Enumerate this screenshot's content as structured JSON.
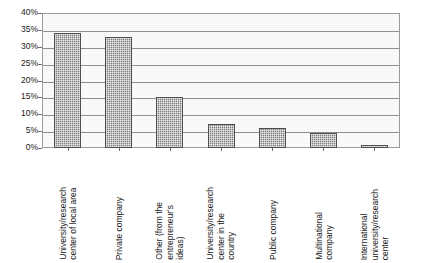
{
  "chart_data": {
    "type": "bar",
    "title": "",
    "xlabel": "",
    "ylabel": "",
    "ylim": [
      0,
      40
    ],
    "ytick_labels": [
      "40%",
      "35%",
      "30%",
      "25%",
      "20%",
      "15%",
      "10%",
      "5%",
      "0%"
    ],
    "ytick_values": [
      40,
      35,
      30,
      25,
      20,
      15,
      10,
      5,
      0
    ],
    "grid": true,
    "legend": "none",
    "categories": [
      "University/research\ncenter of local area",
      "Private company",
      "Other (from the\nentrepreneur's\nideas)",
      "University/research\ncenter in the\ncountry",
      "Public company",
      "Multinational\ncompany",
      "International\nuniversity/research\ncenter"
    ],
    "values": [
      34,
      33,
      15,
      7,
      6,
      4.5,
      1
    ],
    "bar_color": "#7d7d7d",
    "bar_edge_color": "#4f4f4f",
    "plot_bg_color": "#f2f2f2",
    "gridline_color": "#8f8f8f",
    "frame_color": "#9a9a9a"
  }
}
